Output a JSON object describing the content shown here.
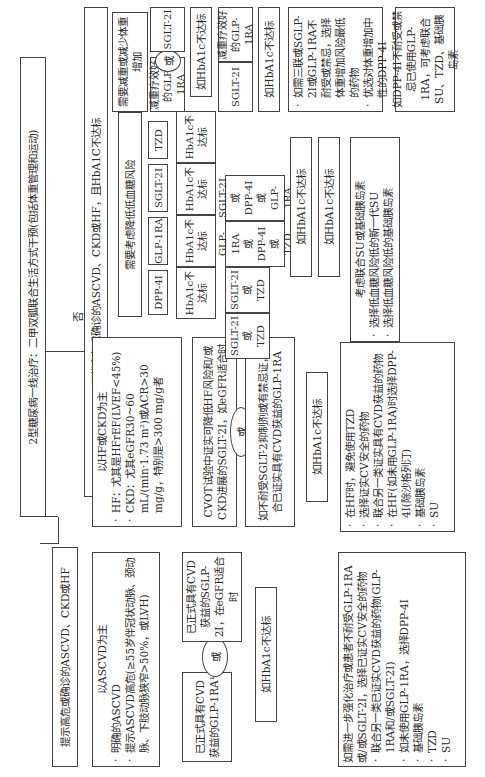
{
  "title": "2型糖尿病一线治疗：二甲双胍联合生活方式干预(包括体重管理和运动)",
  "branch_yes": "提示高危或确诊的ASCVD、CKD或HF",
  "branch_no_label": "否",
  "branch_no": "不伴高危或确诊的ASCVD、CKD或HF，且HbA1C不达标",
  "ascvd": {
    "header": "以ASCVD为主",
    "items": [
      "明确的ASCVD",
      "提示ASCVD高危(≥55岁伴冠状动脉、颈动脉、下肢动脉狭窄>50%，或LVH)"
    ],
    "glp1": "已正式具有CVD获益的GLP-1RA¹",
    "or": "或",
    "sglt2": "已正式具有CVD获益的SGLP-2I，在eGFR适合时",
    "hba1c": "如HbA1c不达标",
    "next": {
      "lead": "如需进一步强化治疗或患者不耐受GLP-1RA或/或SGLT-2I，选择已证实CV安全的药物",
      "items": [
        "联合另一类已证实CVD获益的药物(GLP-1RA和/或SGLT-2I)",
        "如未使用GLP-1RA，选择DPP-4I",
        "基础胰岛素",
        "TZD",
        "SU"
      ]
    }
  },
  "hf_ckd": {
    "header": "以HF或CKD为主",
    "items": [
      "HF：尤其是HFrEF(LVEF<45%)",
      "CKD：尤其eGFR30~60 mL/(min·1.73 m²)或ACR>30 mg/g，特别是>300 mg/g者"
    ],
    "sglt2": "CVOT试验中证实可降低HF风险和/或CKD进展的SGLT-2I，如eGFR适合时",
    "or": "或",
    "glp1": "如不耐受SGLT-2抑制剂或有禁忌证，联合已证实具有CVD获益的GLP-1RA",
    "hba1c": "如HbA1c不达标",
    "next": [
      "在HF时，避免使用TZD",
      "选择证实CV安全的药物",
      "联合另一类证实具有CVD获益的药物",
      "在HF(如未用GLP-1RA)时选择DPP-4I(除沙格列汀)",
      "基础胰岛素",
      "SU"
    ]
  },
  "hypo": {
    "header": "需要考虑降低低血糖风险",
    "drugs": [
      "DPP-4I",
      "GLP-1RA",
      "SGLT-2I",
      "TZD"
    ],
    "hba1c": "HbA1c不达标",
    "combos": [
      {
        "a": "SGLT-2I",
        "or": "或",
        "b": "TZD"
      },
      {
        "a": "SGLT-2I",
        "or": "或",
        "b": "TZD"
      },
      {
        "a": "GLP-1RA",
        "or1": "或",
        "b": "DPP-4I",
        "or2": "或",
        "c": "TZD"
      },
      {
        "a": "SGLT-2I",
        "or1": "或",
        "b": "DPP-4I",
        "or2": "或",
        "c": "GLP-1RA"
      }
    ],
    "hba1c_2": "如HbA1c不达标",
    "hba1c_3": "如HbA1c不达标",
    "final": [
      "考虑联合SU或基础胰岛素",
      "选择低血糖风险低的新一代SU",
      "选择低血糖风险低的基础胰岛素"
    ]
  },
  "weight": {
    "header": "需要减重或减少体重增加",
    "glp1": "减重疗效好的GLP-1RA",
    "or": "或",
    "sglt2": "SGLT-2I",
    "hba1c": "如HbA1c不达标",
    "glp1_2": "减重疗效好的GLP-1RA",
    "sglt2_2": "SGLT-2I",
    "hba1c_2": "如HbA1c不达标",
    "hba1c_3": "如HbA1c不达标",
    "final": [
      "如需三联或SGLP-2I或GLP-1RA不耐受或禁忌，选择体重增加风险最低的药物",
      "优选对体重增加中性的DPP-4I"
    ],
    "dpp4_note": "如DPP-4I不耐受或禁忌已使用GLP-1RA，可考虑联合SU、TZD、基础胰岛素"
  },
  "cost": {
    "header": "费用是主要问题",
    "su": "SU",
    "tzd": "TZD",
    "hba1c": "如HbA1c不达标",
    "tzd_2": "TZD",
    "su_2": "SU",
    "hba1c_2": "如HbA1c不达标",
    "final": [
      "基础胰岛素：选择价格最便宜的",
      "DPP-4I或SGLT-2I：选择价格最便宜的"
    ]
  }
}
